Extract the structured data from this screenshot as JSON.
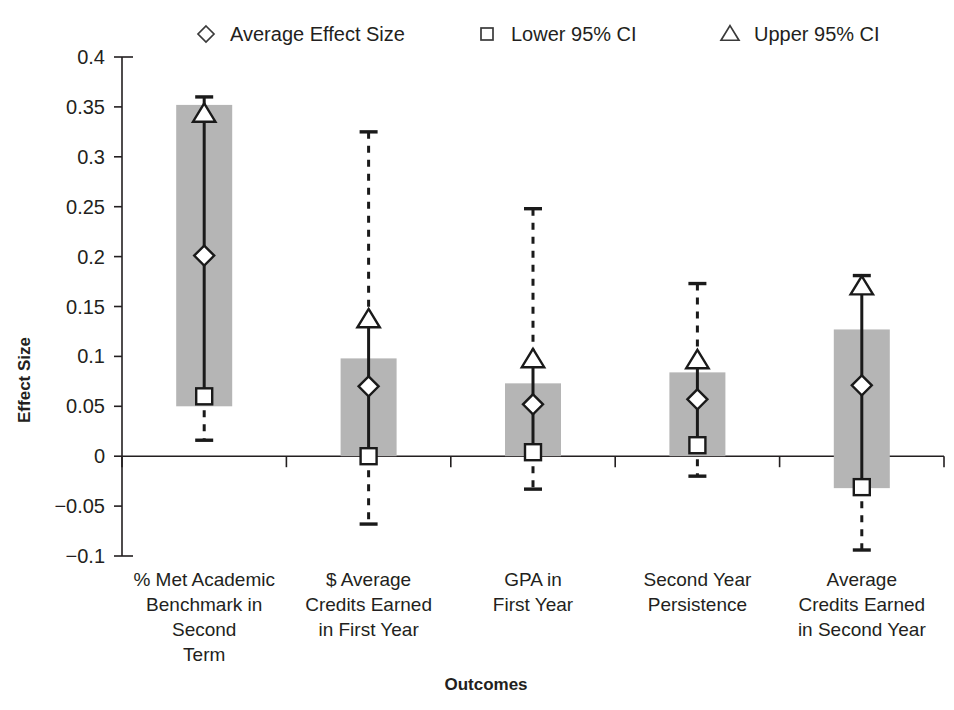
{
  "chart_data": {
    "type": "bar",
    "title": "",
    "xlabel": "Outcomes",
    "ylabel": "Effect Size",
    "ylim": [
      -0.1,
      0.4
    ],
    "ytick_values": [
      0.4,
      0.35,
      0.3,
      0.25,
      0.2,
      0.15,
      0.1,
      0.05,
      0,
      -0.05,
      -0.1
    ],
    "ytick_labels": [
      "0.4",
      "0.35",
      "0.3",
      "0.25",
      "0.2",
      "0.15",
      "0.1",
      "0.05",
      "0",
      "−0.05",
      "−0.1"
    ],
    "grid": false,
    "legend_position": "top",
    "zero_line": 0,
    "bar_color": "#b5b5b5",
    "marker_color": "#1a1a1a",
    "categories": [
      "% Met Academic Benchmark in Second Term",
      "$ Average Credits Earned in First Year",
      "GPA in First Year",
      "Second Year Persistence",
      "Average Credits Earned in Second Year"
    ],
    "category_lines": [
      [
        "% Met Academic",
        "Benchmark in",
        "Second",
        "Term"
      ],
      [
        "$ Average",
        "Credits Earned",
        "in First Year"
      ],
      [
        "GPA in",
        "First Year"
      ],
      [
        "Second Year",
        "Persistence"
      ],
      [
        "Average",
        "Credits Earned",
        "in Second Year"
      ]
    ],
    "series": [
      {
        "name": "Average Effect Size",
        "marker": "diamond",
        "values": [
          0.201,
          0.07,
          0.052,
          0.057,
          0.071
        ]
      },
      {
        "name": "Lower 95% CI",
        "marker": "square",
        "values": [
          0.06,
          0.0,
          0.004,
          0.011,
          -0.031
        ]
      },
      {
        "name": "Upper 95% CI",
        "marker": "triangle",
        "values": [
          0.343,
          0.137,
          0.097,
          0.096,
          0.17
        ]
      }
    ],
    "bars": [
      {
        "bottom": 0.05,
        "top": 0.352
      },
      {
        "bottom": 0.0,
        "top": 0.098
      },
      {
        "bottom": 0.0,
        "top": 0.073
      },
      {
        "bottom": 0.0,
        "top": 0.084
      },
      {
        "bottom": -0.032,
        "top": 0.127
      }
    ],
    "whiskers": [
      {
        "low": 0.016,
        "high": 0.36
      },
      {
        "low": -0.068,
        "high": 0.325
      },
      {
        "low": -0.033,
        "high": 0.248
      },
      {
        "low": -0.02,
        "high": 0.173
      },
      {
        "low": -0.094,
        "high": 0.181
      }
    ]
  },
  "legend": {
    "items": [
      {
        "marker": "diamond",
        "label": "Average Effect Size"
      },
      {
        "marker": "square",
        "label": "Lower 95% CI"
      },
      {
        "marker": "triangle",
        "label": "Upper 95% CI"
      }
    ]
  }
}
